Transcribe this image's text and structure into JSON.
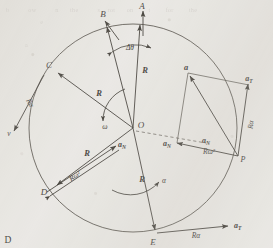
{
  "figure": {
    "panel_label": "D",
    "caption_hidden": "",
    "circle": {
      "center_label": "O",
      "cx": 133,
      "cy": 128,
      "r": 104
    },
    "points": [
      {
        "name": "A",
        "label": "A",
        "x": 143,
        "y": 11
      },
      {
        "name": "B",
        "label": "B",
        "x": 105,
        "y": 18
      },
      {
        "name": "C",
        "label": "C",
        "x": 50,
        "y": 70
      },
      {
        "name": "D",
        "label": "D",
        "x": 52,
        "y": 189
      },
      {
        "name": "E",
        "label": "E",
        "x": 155,
        "y": 234
      },
      {
        "name": "P",
        "label": "P",
        "x": 239,
        "y": 157
      },
      {
        "name": "a_tip",
        "label": "a",
        "x": 189,
        "y": 73
      }
    ],
    "vector_labels": {
      "R_OA": "R",
      "R_OC": "R",
      "R_OD": "R",
      "R_OE": "R",
      "R_alpha_C": "Rα",
      "R_omega2_D": "Rω²",
      "R_omega2_P": "Rω²",
      "R_alpha_P": "Rα",
      "R_alpha_E": "Rα",
      "a_N_center": "a",
      "a_N_center_sub": "N",
      "a_N_D": "a",
      "a_N_D_sub": "N",
      "a_N_P": "a",
      "a_N_P_sub": "N",
      "a_T_P": "a",
      "a_T_P_sub": "T",
      "a_T_E": "a",
      "a_T_E_sub": "T",
      "a_resultant": "a",
      "v_C": "v"
    },
    "angles": {
      "delta_theta": "Δθ",
      "omega": "ω",
      "alpha": "α"
    },
    "colors": {
      "ink": "#45423c",
      "ink_light": "#6a665f",
      "paper": "#eae8e4"
    }
  }
}
